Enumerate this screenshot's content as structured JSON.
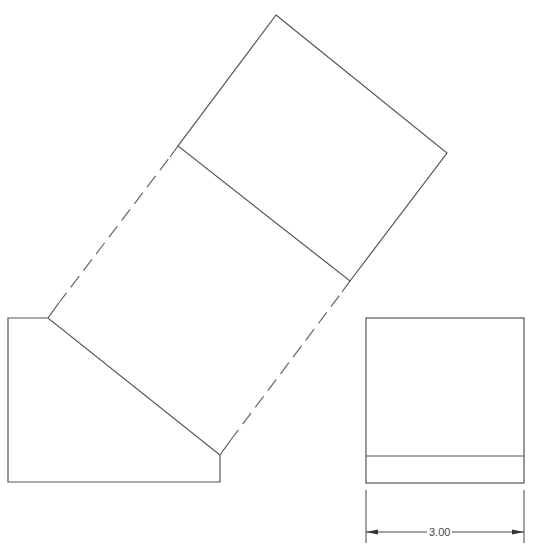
{
  "drawing": {
    "type": "orthographic projection with auxiliary view",
    "line_color": "#555555",
    "views": {
      "front_view": {
        "name": "front view",
        "vertices": [
          [
            8,
            318
          ],
          [
            48,
            318
          ],
          [
            220,
            455
          ],
          [
            220,
            482
          ],
          [
            8,
            482
          ]
        ]
      },
      "side_view": {
        "name": "right side view",
        "outer": [
          366,
          318,
          524,
          483
        ],
        "inner_line_y": 456
      },
      "auxiliary_view": {
        "name": "auxiliary view",
        "outer": [
          [
            276,
            15
          ],
          [
            447,
            153
          ],
          [
            350,
            281
          ],
          [
            48,
            318
          ]
        ],
        "inner_line": [
          [
            178,
            146
          ],
          [
            350,
            281
          ]
        ]
      }
    },
    "projection_lines": [
      {
        "from": [
          48,
          318
        ],
        "to": [
          178,
          146
        ],
        "style": "dashed"
      },
      {
        "from": [
          220,
          455
        ],
        "to": [
          350,
          281
        ],
        "style": "dashed"
      }
    ],
    "dimensions": [
      {
        "label": "3.00",
        "x1": 366,
        "x2": 524,
        "y": 532
      }
    ]
  }
}
